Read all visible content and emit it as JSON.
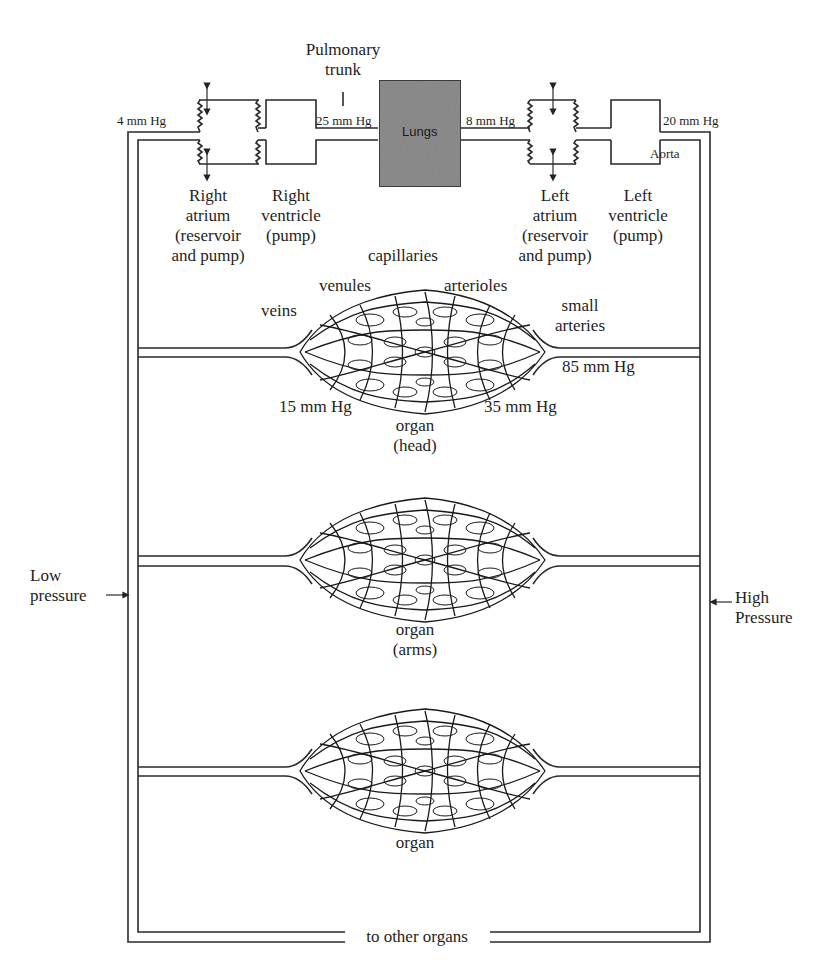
{
  "diagram": {
    "type": "circulatory-system-schematic",
    "heart_chambers": [
      {
        "id": "right-atrium",
        "lines": [
          "Right",
          "atrium",
          "(reservoir",
          "and pump)"
        ]
      },
      {
        "id": "right-ventricle",
        "lines": [
          "Right",
          "ventricle",
          "(pump)"
        ]
      },
      {
        "id": "left-atrium",
        "lines": [
          "Left",
          "atrium",
          "(reservoir",
          "and pump)"
        ]
      },
      {
        "id": "left-ventricle",
        "lines": [
          "Left",
          "ventricle",
          "(pump)"
        ]
      }
    ],
    "pulmonary_trunk": {
      "lines": [
        "Pulmonary",
        "trunk"
      ]
    },
    "lungs": {
      "label": "Lungs",
      "fill": "#8c8c8c"
    },
    "aorta": {
      "label": "Aorta"
    },
    "pressures": {
      "right_atrium": "4 mm Hg",
      "pulmonary_trunk": "25 mm Hg",
      "left_atrium": "8 mm Hg",
      "aorta": "20 mm Hg",
      "small_arteries": "85 mm Hg",
      "arterioles": "35 mm Hg",
      "venules": "15 mm Hg"
    },
    "vessel_labels": {
      "capillaries": "capillaries",
      "venules": "venules",
      "arterioles": "arterioles",
      "veins": "veins",
      "small_arteries": [
        "small",
        "arteries"
      ]
    },
    "organs": [
      {
        "id": "head",
        "lines": [
          "organ",
          "(head)"
        ]
      },
      {
        "id": "arms",
        "lines": [
          "organ",
          "(arms)"
        ]
      },
      {
        "id": "generic",
        "lines": [
          "organ"
        ]
      }
    ],
    "side_labels": {
      "low": [
        "Low",
        "pressure"
      ],
      "high": [
        "High",
        "Pressure"
      ]
    },
    "bottom_label": "to other organs"
  }
}
